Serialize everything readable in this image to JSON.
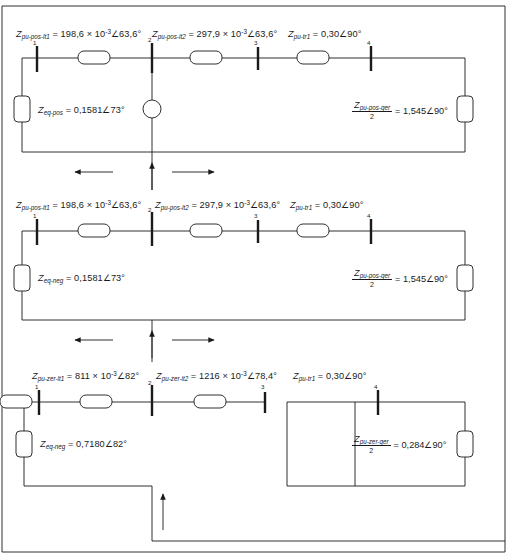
{
  "diagram": {
    "line_color": "#1a1a1a",
    "background": "#ffffff",
    "sections": [
      {
        "id": "positive-sequence",
        "labels": {
          "line1": {
            "symbol": "Z",
            "sub": "pu-pos-lt1",
            "value": "= 198,6 × 10",
            "exp": "-3",
            "angle": "∠63,6°"
          },
          "line2": {
            "symbol": "Z",
            "sub": "pu-pos-lt2",
            "value": "= 297,9 × 10",
            "exp": "-3",
            "angle": "∠63,6°"
          },
          "tr1": {
            "symbol": "Z",
            "sub": "pu-tr1",
            "value": "= 0,30∠90°"
          },
          "eq": {
            "symbol": "Z",
            "sub": "eq-pos",
            "value": "= 0,1581∠73°"
          },
          "gen": {
            "symbol": "Z",
            "sub": "pu-pos-ger",
            "den": "2",
            "value": "= 1,545∠90°"
          }
        },
        "nodes": [
          "1",
          "2",
          "3",
          "4"
        ]
      },
      {
        "id": "negative-sequence",
        "labels": {
          "line1": {
            "symbol": "Z",
            "sub": "pu-pos-lt1",
            "value": "= 198,6 × 10",
            "exp": "-3",
            "angle": "∠63,6°"
          },
          "line2": {
            "symbol": "Z",
            "sub": "pu-pos-lt2",
            "value": "= 297,9 × 10",
            "exp": "-3",
            "angle": "∠63,6°"
          },
          "tr1": {
            "symbol": "Z",
            "sub": "pu-tr1",
            "value": "= 0,30∠90°"
          },
          "eq": {
            "symbol": "Z",
            "sub": "eq-neg",
            "value": "= 0,1581∠73°"
          },
          "gen": {
            "symbol": "Z",
            "sub": "pu-pos-ger",
            "den": "2",
            "value": "= 1,545∠90°"
          }
        },
        "nodes": [
          "1",
          "2",
          "3",
          "4"
        ]
      },
      {
        "id": "zero-sequence",
        "labels": {
          "line1": {
            "symbol": "Z",
            "sub": "pu-zer-lt1",
            "value": "= 811 × 10",
            "exp": "-3",
            "angle": "∠82°"
          },
          "line2": {
            "symbol": "Z",
            "sub": "pu-zer-lt2",
            "value": "= 1216 × 10",
            "exp": "-3",
            "angle": "∠78,4°"
          },
          "tr1": {
            "symbol": "Z",
            "sub": "pu-tr1",
            "value": "= 0,30∠90°"
          },
          "eq": {
            "symbol": "Z",
            "sub": "eq-neg",
            "value": "= 0,7180∠82°"
          },
          "gen": {
            "symbol": "Z",
            "sub": "pu-zer-ger",
            "den": "2",
            "value": "= 0,284∠90°"
          }
        },
        "nodes": [
          "1",
          "2",
          "3",
          "4"
        ]
      }
    ]
  }
}
